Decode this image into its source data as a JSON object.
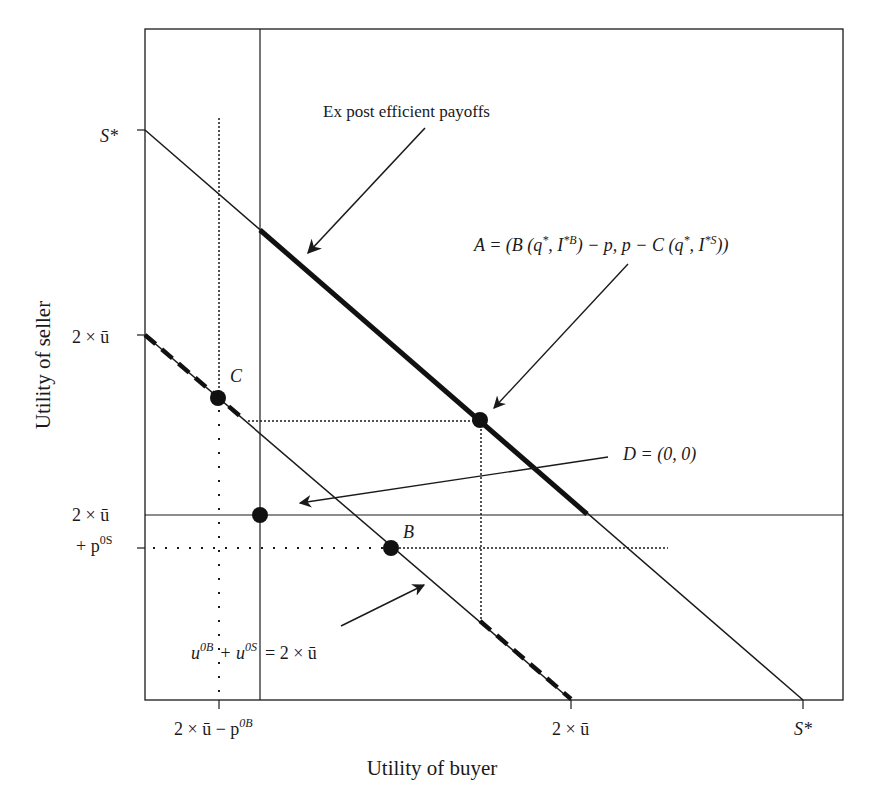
{
  "diagram": {
    "x_axis_label": "Utility of buyer",
    "y_axis_label": "Utility of seller",
    "y_ticks": {
      "s_star": "S*",
      "two_u_bar": "2 × ū",
      "two_u_bar_p_line1": "2 × ū",
      "two_u_bar_p_line2": "+ p",
      "two_u_bar_p_sup": "0S"
    },
    "x_ticks": {
      "two_u_bar_minus_p": "2 × ū − p",
      "two_u_bar_minus_p_sup": "0B",
      "two_u_bar": "2 × ū",
      "s_star": "S*"
    },
    "annotations": {
      "ex_post": "Ex post efficient payoffs",
      "point_a": "A = (B (q*, I*B) − p, p − C (q*, I*S))",
      "point_a_parts": {
        "p1": "A = (B (q",
        "s1": "*",
        "p2": ", I",
        "s2": "*B",
        "p3": ") − p, p − C (q",
        "s3": "*",
        "p4": ", I",
        "s4": "*S",
        "p5": "))"
      },
      "point_d": "D = (0, 0)",
      "constraint": {
        "u1": "u",
        "sup1": "0B",
        "plus": "+ u",
        "sup2": "0S",
        "rhs": "= 2 × ū"
      }
    },
    "point_labels": {
      "b": "B",
      "c": "C"
    },
    "colors": {
      "ink": "#1a1a1a",
      "background": "#ffffff"
    }
  }
}
